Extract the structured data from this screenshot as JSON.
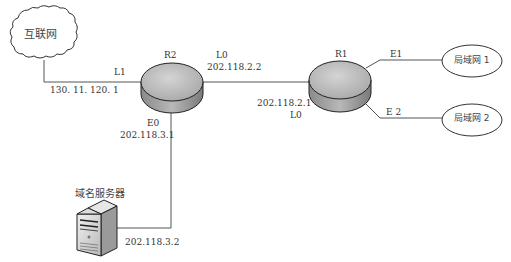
{
  "diagram": {
    "type": "network-topology",
    "nodes": {
      "internet": {
        "label": "互联网",
        "shape": "cloud"
      },
      "r2": {
        "label": "R2",
        "shape": "router"
      },
      "r1": {
        "label": "R1",
        "shape": "router"
      },
      "lan1": {
        "label": "局域网 1",
        "shape": "ellipse"
      },
      "lan2": {
        "label": "局域网 2",
        "shape": "ellipse"
      },
      "dns": {
        "label": "域名服务器",
        "shape": "server"
      }
    },
    "interfaces": {
      "r2_l1": {
        "name": "L1",
        "ip": "130. 11. 120. 1"
      },
      "r2_l0": {
        "name": "L0",
        "ip": "202.118.2.2"
      },
      "r2_e0": {
        "name": "E0",
        "ip": "202.118.3.1"
      },
      "r1_l0": {
        "name": "L0",
        "ip": "202.118.2.1"
      },
      "r1_e1": {
        "name": "E1"
      },
      "r1_e2": {
        "name": "E 2"
      },
      "dns_ip": {
        "ip": "202.118.3.2"
      }
    },
    "colors": {
      "line": "#555555",
      "router_top": "#c8c8c8",
      "router_side": "#9a9a9a",
      "outline": "#222222"
    }
  }
}
